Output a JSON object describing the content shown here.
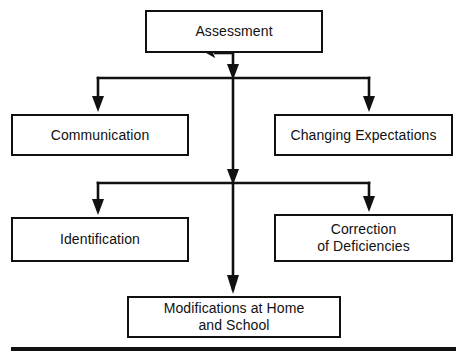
{
  "diagram": {
    "type": "flowchart",
    "orientation": "top-down",
    "line_color": "#111111",
    "background_color": "#ffffff",
    "nodes": [
      {
        "id": "assessment",
        "label": "Assessment",
        "level": 0,
        "column": "center"
      },
      {
        "id": "communication",
        "label": "Communication",
        "level": 1,
        "column": "left"
      },
      {
        "id": "expectations",
        "label": "Changing Expectations",
        "level": 1,
        "column": "right"
      },
      {
        "id": "identification",
        "label": "Identification",
        "level": 2,
        "column": "left"
      },
      {
        "id": "correction",
        "label": "Correction\nof Deficiencies",
        "level": 2,
        "column": "right"
      },
      {
        "id": "modifications",
        "label": "Modifications at Home\nand School",
        "level": 3,
        "column": "center"
      }
    ],
    "edges": [
      {
        "from": "assessment",
        "to": "communication",
        "style": "elbow-arrow"
      },
      {
        "from": "assessment",
        "to": "expectations",
        "style": "elbow-arrow"
      },
      {
        "from": "assessment",
        "to": "identification",
        "style": "elbow-arrow"
      },
      {
        "from": "assessment",
        "to": "correction",
        "style": "elbow-arrow"
      },
      {
        "from": "assessment",
        "to": "modifications",
        "style": "straight-arrow"
      }
    ],
    "footer_rule": "horizontal-rule"
  }
}
